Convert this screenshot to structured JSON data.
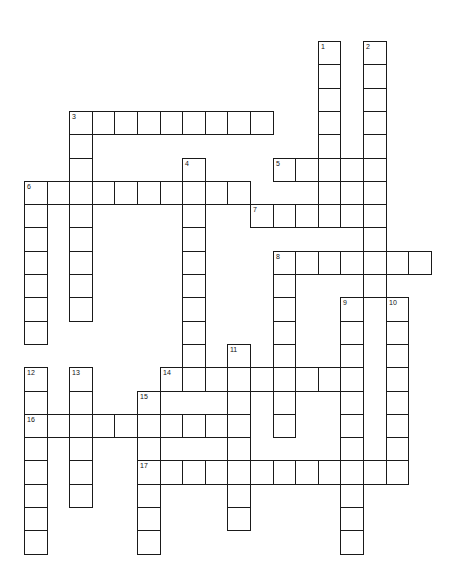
{
  "puzzle": {
    "type": "crossword",
    "grid": {
      "origin_x": 24,
      "origin_y": 41,
      "cell_width": 22.6,
      "cell_height": 23.3,
      "line_color": "#1a1a1a",
      "cell_fill": "#ffffff"
    },
    "across": [
      {
        "number": "3",
        "row": 3,
        "col": 2,
        "length": 9
      },
      {
        "number": "5",
        "row": 5,
        "col": 11,
        "length": 5
      },
      {
        "number": "6",
        "row": 6,
        "col": 0,
        "length": 10
      },
      {
        "number": "7",
        "row": 7,
        "col": 10,
        "length": 6
      },
      {
        "number": "8",
        "row": 9,
        "col": 11,
        "length": 7
      },
      {
        "number": "14",
        "row": 14,
        "col": 6,
        "length": 9
      },
      {
        "number": "16",
        "row": 16,
        "col": 0,
        "length": 10
      },
      {
        "number": "17",
        "row": 18,
        "col": 5,
        "length": 12
      }
    ],
    "down": [
      {
        "number": "1",
        "row": 0,
        "col": 13,
        "length": 8
      },
      {
        "number": "2",
        "row": 0,
        "col": 15,
        "length": 11
      },
      {
        "number": "3",
        "row": 3,
        "col": 2,
        "length": 9
      },
      {
        "number": "4",
        "row": 5,
        "col": 7,
        "length": 10
      },
      {
        "number": "6",
        "row": 6,
        "col": 0,
        "length": 7
      },
      {
        "number": "8",
        "row": 9,
        "col": 11,
        "length": 8
      },
      {
        "number": "9",
        "row": 11,
        "col": 14,
        "length": 11
      },
      {
        "number": "10",
        "row": 11,
        "col": 16,
        "length": 8
      },
      {
        "number": "11",
        "row": 13,
        "col": 9,
        "length": 8
      },
      {
        "number": "12",
        "row": 14,
        "col": 0,
        "length": 8
      },
      {
        "number": "13",
        "row": 14,
        "col": 2,
        "length": 6
      },
      {
        "number": "15",
        "row": 15,
        "col": 5,
        "length": 7
      }
    ],
    "extra_cells": [
      {
        "row": 6,
        "col": 14
      }
    ]
  }
}
